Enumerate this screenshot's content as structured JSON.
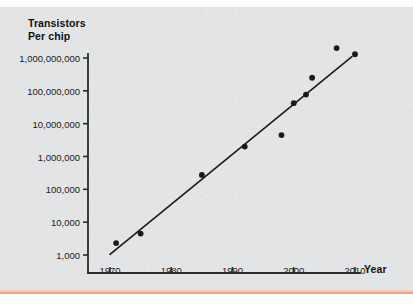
{
  "chart_data": {
    "type": "scatter",
    "title": "",
    "subtitle": "",
    "ylabel_line1": "Transistors",
    "ylabel_line2": "Per chip",
    "xlabel": "Year",
    "xlim": [
      1966,
      2012
    ],
    "ylim": [
      1000,
      2000000000
    ],
    "yscale": "log",
    "grid": false,
    "legend": null,
    "xtick_labels": [
      "1970",
      "1980",
      "1990",
      "2000",
      "2010"
    ],
    "xtick_values": [
      1970,
      1980,
      1990,
      2000,
      2010
    ],
    "ytick_labels": [
      "1,000,000,000",
      "100,000,000",
      "10,000,000",
      "1,000,000",
      "100,000",
      "10,000",
      "1,000"
    ],
    "ytick_values": [
      1000000000,
      100000000,
      10000000,
      1000000,
      100000,
      10000,
      1000
    ],
    "series": [
      {
        "name": "Transistors per chip",
        "marker": "filled-circle",
        "color": "#1a1a1a",
        "points": [
          {
            "x": 1971,
            "y": 2300
          },
          {
            "x": 1975,
            "y": 4500
          },
          {
            "x": 1985,
            "y": 275000
          },
          {
            "x": 1992,
            "y": 2000000
          },
          {
            "x": 1998,
            "y": 4500000
          },
          {
            "x": 2000,
            "y": 42000000
          },
          {
            "x": 2002,
            "y": 77000000
          },
          {
            "x": 2003,
            "y": 250000000
          },
          {
            "x": 2007,
            "y": 2000000000
          },
          {
            "x": 2010,
            "y": 1300000000
          }
        ]
      },
      {
        "name": "Trend line (Moore's Law fit)",
        "marker": "none",
        "color": "#1a1a1a",
        "points": [
          {
            "x": 1970,
            "y": 1050
          },
          {
            "x": 2009.5,
            "y": 1100000000
          }
        ]
      }
    ],
    "annotations": []
  },
  "colors": {
    "paper": "#e3e4e6",
    "ink": "#1a1a1a",
    "axis": "#2b2b2b",
    "rule": "#e9a87c"
  }
}
